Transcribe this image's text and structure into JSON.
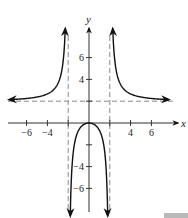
{
  "chart_data": {
    "type": "line",
    "title": "",
    "xlabel": "x",
    "ylabel": "y",
    "xlim": [
      -8,
      8
    ],
    "ylim": [
      -8,
      9
    ],
    "grid": false,
    "function": "y = 2x^2 / (x^2 - 4)",
    "x_ticks": [
      -6,
      -4,
      -2,
      2,
      4,
      6
    ],
    "x_tick_labels": [
      "−6",
      "−4",
      "",
      "",
      "4",
      "6"
    ],
    "y_ticks": [
      -6,
      -4,
      -2,
      2,
      4,
      6
    ],
    "y_tick_labels": [
      "−6",
      "−4",
      "",
      "",
      "4",
      "6"
    ],
    "asymptotes": {
      "vertical": [
        -2,
        2
      ],
      "horizontal": [
        2
      ]
    },
    "series": [
      {
        "name": "left branch",
        "x": [
          -7.6,
          -6,
          -4,
          -3,
          -2.6,
          -2.4,
          -2.3
        ],
        "y": [
          2.15,
          2.25,
          2.67,
          3.6,
          4.9,
          6.55,
          7.95
        ]
      },
      {
        "name": "middle branch",
        "x": [
          -1.9,
          -1.5,
          -1,
          -0.5,
          0,
          0.5,
          1,
          1.5,
          1.9
        ],
        "y": [
          -18.5,
          -2.57,
          -0.67,
          -0.13,
          0,
          -0.13,
          -0.67,
          -2.57,
          -18.5
        ]
      },
      {
        "name": "right branch",
        "x": [
          2.3,
          2.4,
          2.6,
          3,
          4,
          6,
          7.6
        ],
        "y": [
          7.95,
          6.55,
          4.9,
          3.6,
          2.67,
          2.25,
          2.15
        ]
      }
    ]
  },
  "axes": {
    "x_label": "x",
    "y_label": "y"
  }
}
